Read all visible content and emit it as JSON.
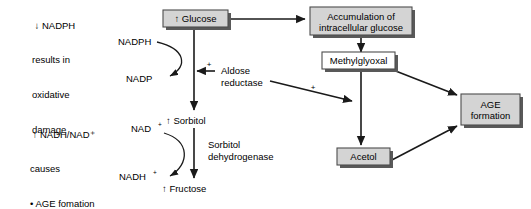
{
  "diagram": {
    "notes": [
      {
        "id": "nadph-note",
        "lines": [
          "↓ NADPH",
          "results in",
          "oxidative",
          "damage"
        ]
      },
      {
        "id": "nadh-nad-note",
        "lines": [
          "↑ NADH/NAD⁺",
          "causes",
          "• AGE fomation",
          "• PKC activation"
        ]
      }
    ],
    "boxes": [
      {
        "id": "glucose",
        "label": "↑ Glucose",
        "fill": "#d4d4d4"
      },
      {
        "id": "accumulation",
        "label": "Accumulation of\nintracellular glucose",
        "line1": "Accumulation of",
        "line2": "intracellular glucose",
        "fill": "#d4d4d4"
      },
      {
        "id": "methylglyoxal",
        "label": "Methylglyoxal",
        "fill": "#ffffff"
      },
      {
        "id": "acetol",
        "label": "Acetol",
        "fill": "#d4d4d4"
      },
      {
        "id": "age-formation",
        "label": "AGE\nformation",
        "line1": "AGE",
        "line2": "formation",
        "fill": "#d4d4d4"
      }
    ],
    "metabolites": [
      {
        "id": "nadph",
        "label": "NADPH"
      },
      {
        "id": "nadp",
        "label": "NADP"
      },
      {
        "id": "sorbitol",
        "label": "↑ Sorbitol"
      },
      {
        "id": "fructose",
        "label": "↑ Fructose"
      },
      {
        "id": "nad-plus",
        "label": "NAD",
        "sup": "+"
      },
      {
        "id": "nadh-plus",
        "label": "NADH",
        "sup": "+"
      }
    ],
    "enzymes": [
      {
        "id": "aldose-reductase",
        "line1": "Aldose",
        "line2": "reductase"
      },
      {
        "id": "sorbitol-dehydrogenase",
        "line1": "Sorbitol",
        "line2": "dehydrogenase"
      }
    ],
    "modifiers": [
      {
        "id": "plus-aldose-reductase-to-polyol",
        "label": "+"
      },
      {
        "id": "plus-aldose-reductase-to-acetol",
        "label": "+"
      }
    ],
    "colors": {
      "box_gray": "#d4d4d4",
      "box_white": "#ffffff",
      "box_border": "#4d4d4d",
      "box_shadow": "#595959",
      "stroke": "#1a1a1a",
      "text": "#000000",
      "background": "#ffffff"
    }
  }
}
